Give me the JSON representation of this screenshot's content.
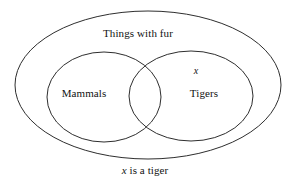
{
  "diagram": {
    "type": "euler-venn",
    "outer_set": {
      "label": "Things with fur"
    },
    "left_set": {
      "label": "Mammals"
    },
    "right_set": {
      "label": "Tigers"
    },
    "element_marker": {
      "label": "x",
      "located_in": "Tigers"
    },
    "caption": {
      "marker": "x",
      "text": "is a tiger"
    },
    "colors": {
      "background": "#ffffff",
      "stroke": "#2e2e2e",
      "text": "#111111"
    }
  }
}
